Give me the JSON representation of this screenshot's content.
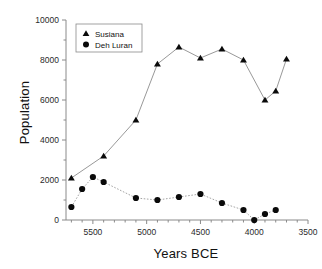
{
  "chart_data": {
    "type": "line",
    "title": "",
    "xlabel": "Years BCE",
    "ylabel": "Population",
    "xlim": [
      5750,
      3500
    ],
    "ylim": [
      0,
      10000
    ],
    "x_reversed": true,
    "grid": false,
    "legend_position": "top-left",
    "xticks": [
      5500,
      5000,
      4500,
      4000,
      3500
    ],
    "xtick_labels": [
      "5500",
      "5000",
      "4500",
      "4000",
      "3500"
    ],
    "x_minor_tick_step": 100,
    "yticks": [
      0,
      2000,
      4000,
      6000,
      8000,
      10000
    ],
    "ytick_labels": [
      "0",
      "2000",
      "4000",
      "6000",
      "8000",
      "10000"
    ],
    "y_minor_tick_step": 1000,
    "series": [
      {
        "name": "Susiana",
        "marker": "triangle",
        "linestyle": "solid",
        "color": "#0a0a0a",
        "x": [
          5700,
          5400,
          5100,
          4900,
          4700,
          4500,
          4300,
          4100,
          3900,
          3800,
          3700
        ],
        "values": [
          2100,
          3200,
          5000,
          7800,
          8650,
          8100,
          8550,
          8000,
          6000,
          6450,
          8050
        ]
      },
      {
        "name": "Deh Luran",
        "marker": "circle",
        "linestyle": "dotted",
        "color": "#0a0a0a",
        "x": [
          5700,
          5600,
          5500,
          5400,
          5100,
          4900,
          4700,
          4500,
          4300,
          4100,
          4000,
          3900,
          3800
        ],
        "values": [
          650,
          1550,
          2150,
          1900,
          1100,
          1000,
          1150,
          1300,
          850,
          500,
          0,
          300,
          500
        ]
      }
    ]
  },
  "labels": {
    "y_axis_title": "Population",
    "x_axis_title": "Years BCE",
    "legend_susiana": "Susiana",
    "legend_deh_luran": "Deh Luran"
  }
}
